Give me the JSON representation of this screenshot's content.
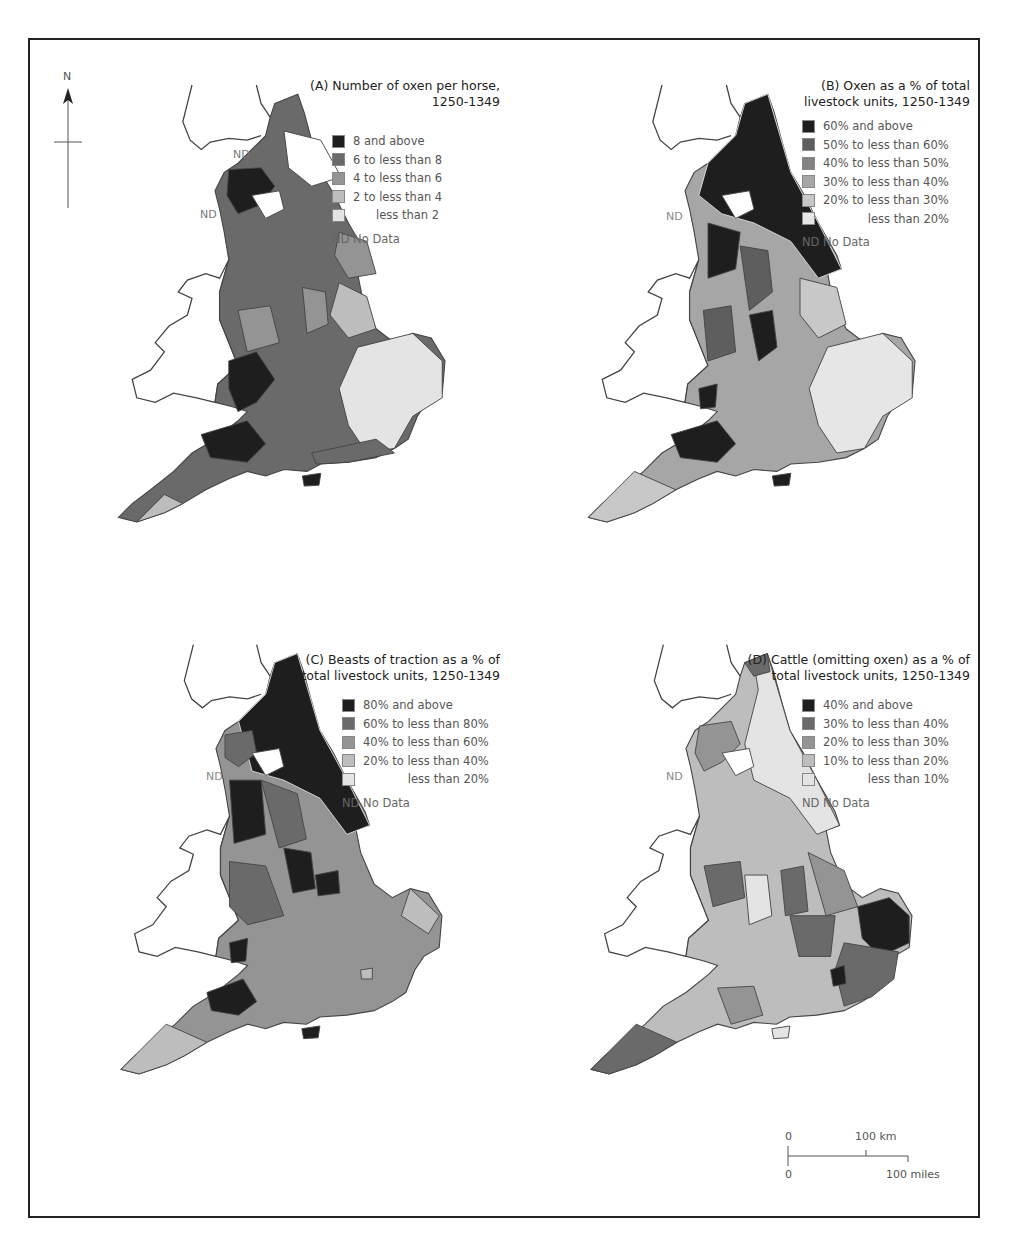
{
  "figure": {
    "north_label": "N",
    "nd_marker": "ND",
    "scale": {
      "zero_top": "0",
      "km_label": "100 km",
      "zero_bottom": "0",
      "miles_label": "100 miles"
    }
  },
  "panels": [
    {
      "id": "A",
      "title_line1": "(A)  Number of oxen per horse,",
      "title_line2": "1250-1349",
      "legend": [
        {
          "label": "8 and above",
          "color": "#1e1e1e"
        },
        {
          "label": "6 to less than 8",
          "color": "#6a6a6a"
        },
        {
          "label": "4 to less than 6",
          "color": "#949494"
        },
        {
          "label": "2 to less than 4",
          "color": "#bdbdbd"
        },
        {
          "label": "less than 2",
          "color": "#e4e4e4"
        }
      ],
      "no_data": "ND  No Data"
    },
    {
      "id": "B",
      "title_line1": "(B)  Oxen as a % of total",
      "title_line2": "livestock units, 1250-1349",
      "legend": [
        {
          "label": "60% and above",
          "color": "#1e1e1e"
        },
        {
          "label": "50% to less than 60%",
          "color": "#5e5e5e"
        },
        {
          "label": "40% to less than 50%",
          "color": "#838383"
        },
        {
          "label": "30% to less than 40%",
          "color": "#a6a6a6"
        },
        {
          "label": "20% to less than 30%",
          "color": "#c8c8c8"
        },
        {
          "label": "less than 20%",
          "color": "#e6e6e6"
        }
      ],
      "no_data": "ND  No Data"
    },
    {
      "id": "C",
      "title_line1": "(C)  Beasts of traction as a % of",
      "title_line2": "total livestock units, 1250-1349",
      "legend": [
        {
          "label": "80% and above",
          "color": "#1e1e1e"
        },
        {
          "label": "60% to less than 80%",
          "color": "#6a6a6a"
        },
        {
          "label": "40% to less than 60%",
          "color": "#949494"
        },
        {
          "label": "20% to less than 40%",
          "color": "#bdbdbd"
        },
        {
          "label": "less than 20%",
          "color": "#e4e4e4"
        }
      ],
      "no_data": "ND  No Data"
    },
    {
      "id": "D",
      "title_line1": "(D)  Cattle (omitting oxen) as a % of",
      "title_line2": "total livestock units, 1250-1349",
      "legend": [
        {
          "label": "40% and above",
          "color": "#1e1e1e"
        },
        {
          "label": "30% to less than 40%",
          "color": "#6a6a6a"
        },
        {
          "label": "20% to less than 30%",
          "color": "#949494"
        },
        {
          "label": "10% to less than 20%",
          "color": "#bdbdbd"
        },
        {
          "label": "less than 10%",
          "color": "#e4e4e4"
        }
      ],
      "no_data": "ND  No Data"
    }
  ]
}
